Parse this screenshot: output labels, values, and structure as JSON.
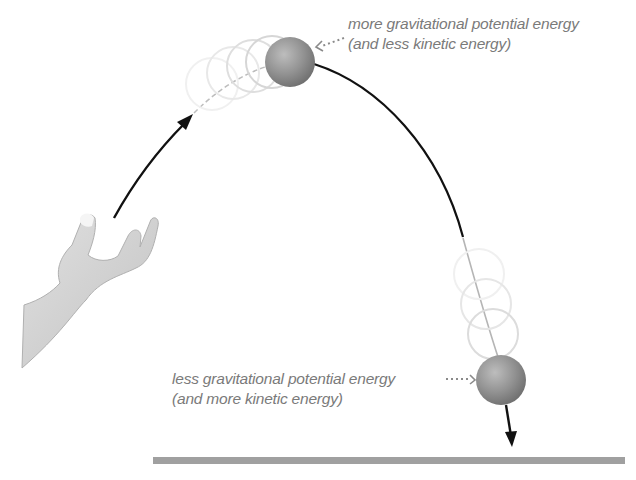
{
  "figure": {
    "labels": {
      "top_line1": "more gravitational potential energy",
      "top_line2": "(and less kinetic energy)",
      "bottom_line1": "less gravitational potential energy",
      "bottom_line2": "(and more kinetic energy)"
    },
    "colors": {
      "ball": "#8c8c8c",
      "ball_highlight": "#b8b8b8",
      "trajectory": "#1a1a1a",
      "ghost": "#dcdcdc",
      "ground": "#9a9a9a",
      "hand": "#cfcfcf",
      "label_text": "#7a7a7a"
    },
    "elements": {
      "hand": "hand-icon",
      "ball_top": "ball-at-peak",
      "ball_bottom": "ball-falling",
      "ground": "ground-line"
    }
  }
}
